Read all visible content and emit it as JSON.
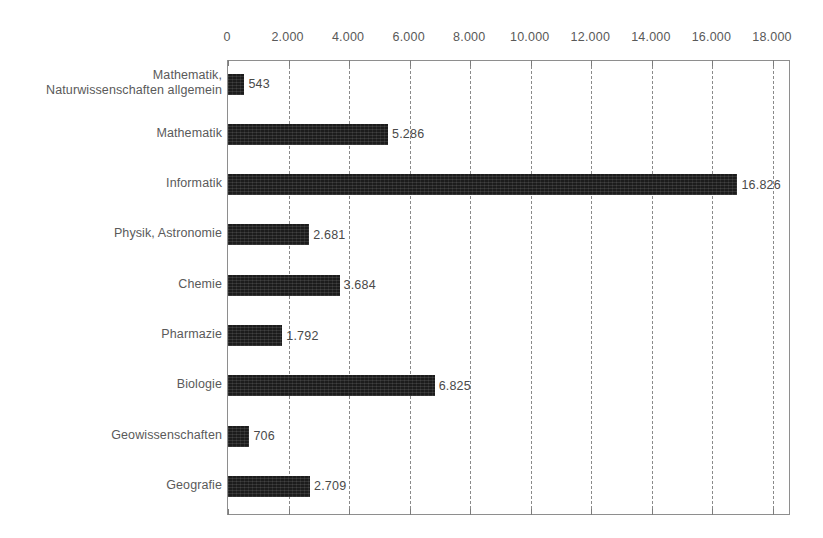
{
  "chart_data": {
    "type": "bar",
    "orientation": "horizontal",
    "title": "",
    "subtitle": "",
    "xlabel": "",
    "ylabel": "",
    "xlim": [
      0,
      18000
    ],
    "xtick_step": 2000,
    "grid": true,
    "legend": null,
    "number_format": "de-DE (period thousands separator)",
    "axis_position": "top",
    "categories": [
      "Mathematik,\nNaturwissenschaften allgemein",
      "Mathematik",
      "Informatik",
      "Physik, Astronomie",
      "Chemie",
      "Pharmazie",
      "Biologie",
      "Geowissenschaften",
      "Geografie"
    ],
    "values": [
      543,
      5286,
      16826,
      2681,
      3684,
      1792,
      6825,
      706,
      2709
    ],
    "value_labels": [
      "543",
      "5.286",
      "16.826",
      "2.681",
      "3.684",
      "1.792",
      "6.825",
      "706",
      "2.709"
    ],
    "tick_values": [
      0,
      2000,
      4000,
      6000,
      8000,
      10000,
      12000,
      14000,
      16000,
      18000
    ],
    "tick_labels": [
      "0",
      "2.000",
      "4.000",
      "6.000",
      "8.000",
      "10.000",
      "12.000",
      "14.000",
      "16.000",
      "18.000"
    ],
    "colors": {
      "bar": "#1c1c1c",
      "background": "#ffffff",
      "axis": "#8e8e8e",
      "gridline": "#8a8a8a",
      "text": "#5a5a5a"
    }
  }
}
